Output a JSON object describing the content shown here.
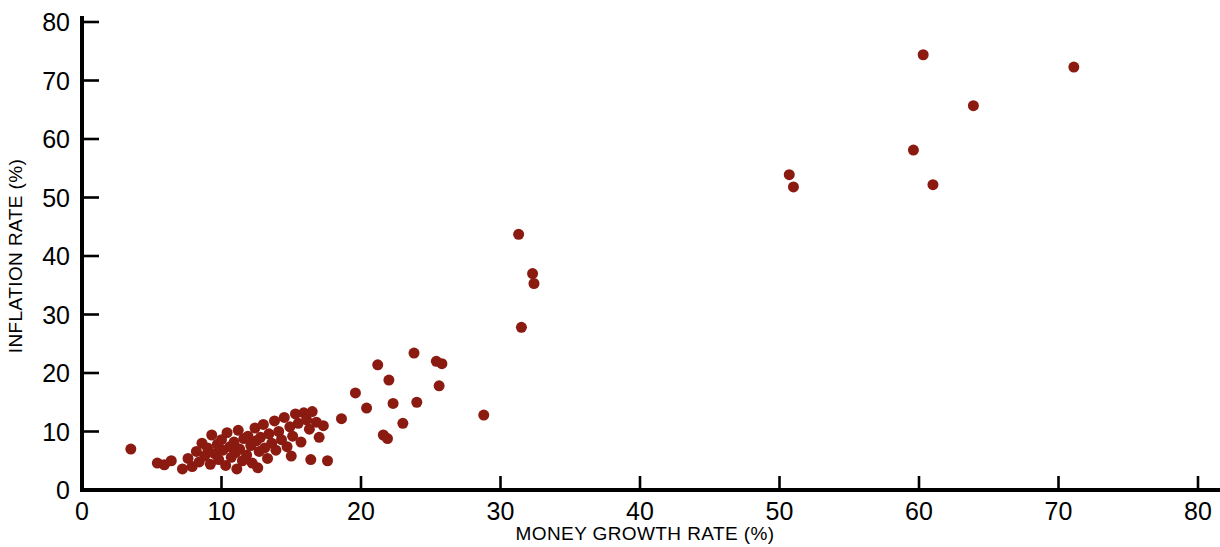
{
  "chart_data": {
    "type": "scatter",
    "title": "",
    "subtitle": "",
    "xlabel": "MONEY GROWTH RATE (%)",
    "ylabel": "INFLATION RATE (%)",
    "xlim": [
      0,
      80
    ],
    "ylim": [
      0,
      80
    ],
    "xticks": [
      0,
      10,
      20,
      30,
      40,
      50,
      60,
      70,
      80
    ],
    "yticks": [
      0,
      10,
      20,
      30,
      40,
      50,
      60,
      70,
      80
    ],
    "xtick_labels": [
      "0",
      "10",
      "20",
      "30",
      "40",
      "50",
      "60",
      "70",
      "80"
    ],
    "ytick_labels": [
      "0",
      "10",
      "20",
      "30",
      "40",
      "50",
      "60",
      "70",
      "80"
    ],
    "grid": false,
    "legend": null,
    "legend_position": "none",
    "annotations": [],
    "marker": {
      "shape": "circle",
      "color": "#8B1A10",
      "radius_px": 5.5,
      "edge_color": "none"
    },
    "series": [
      {
        "name": "Countries",
        "color": "#8B1A10",
        "points": [
          [
            3.5,
            7.0
          ],
          [
            5.4,
            4.6
          ],
          [
            5.9,
            4.3
          ],
          [
            6.4,
            5.0
          ],
          [
            7.2,
            3.6
          ],
          [
            7.6,
            5.4
          ],
          [
            7.9,
            4.0
          ],
          [
            8.2,
            6.6
          ],
          [
            8.4,
            4.8
          ],
          [
            8.6,
            8.0
          ],
          [
            8.8,
            5.8
          ],
          [
            9.0,
            7.2
          ],
          [
            9.2,
            4.4
          ],
          [
            9.3,
            9.4
          ],
          [
            9.5,
            6.2
          ],
          [
            9.7,
            7.8
          ],
          [
            9.8,
            5.2
          ],
          [
            10.0,
            8.6
          ],
          [
            10.1,
            6.8
          ],
          [
            10.3,
            4.2
          ],
          [
            10.4,
            9.8
          ],
          [
            10.6,
            7.4
          ],
          [
            10.7,
            5.6
          ],
          [
            10.9,
            8.2
          ],
          [
            11.0,
            6.4
          ],
          [
            11.2,
            10.2
          ],
          [
            11.3,
            7.0
          ],
          [
            11.5,
            5.0
          ],
          [
            11.6,
            8.8
          ],
          [
            11.8,
            6.0
          ],
          [
            11.9,
            9.2
          ],
          [
            12.1,
            7.6
          ],
          [
            12.2,
            4.6
          ],
          [
            12.4,
            10.6
          ],
          [
            12.5,
            8.4
          ],
          [
            12.7,
            6.6
          ],
          [
            12.8,
            9.0
          ],
          [
            13.0,
            11.2
          ],
          [
            13.1,
            7.2
          ],
          [
            13.3,
            5.4
          ],
          [
            13.4,
            9.6
          ],
          [
            13.6,
            8.0
          ],
          [
            13.8,
            11.8
          ],
          [
            13.9,
            6.8
          ],
          [
            14.1,
            10.0
          ],
          [
            14.3,
            8.6
          ],
          [
            14.5,
            12.4
          ],
          [
            14.7,
            7.4
          ],
          [
            14.9,
            10.8
          ],
          [
            15.1,
            9.2
          ],
          [
            15.3,
            13.0
          ],
          [
            15.5,
            11.4
          ],
          [
            15.7,
            8.2
          ],
          [
            15.9,
            13.2
          ],
          [
            16.1,
            12.0
          ],
          [
            16.3,
            10.4
          ],
          [
            16.5,
            13.4
          ],
          [
            16.8,
            11.6
          ],
          [
            17.0,
            9.0
          ],
          [
            17.3,
            11.0
          ],
          [
            17.6,
            5.0
          ],
          [
            16.4,
            5.2
          ],
          [
            15.0,
            5.8
          ],
          [
            12.6,
            3.8
          ],
          [
            11.1,
            3.6
          ],
          [
            18.6,
            12.2
          ],
          [
            19.6,
            16.6
          ],
          [
            20.4,
            14.0
          ],
          [
            21.2,
            21.4
          ],
          [
            21.6,
            9.4
          ],
          [
            21.9,
            8.8
          ],
          [
            22.0,
            18.8
          ],
          [
            22.3,
            14.8
          ],
          [
            23.0,
            11.4
          ],
          [
            23.8,
            23.4
          ],
          [
            24.0,
            15.0
          ],
          [
            25.4,
            22.0
          ],
          [
            25.6,
            17.8
          ],
          [
            25.8,
            21.6
          ],
          [
            28.8,
            12.8
          ],
          [
            31.3,
            43.7
          ],
          [
            31.5,
            27.8
          ],
          [
            32.3,
            37.0
          ],
          [
            32.4,
            35.3
          ],
          [
            50.7,
            53.9
          ],
          [
            51.0,
            51.8
          ],
          [
            59.6,
            58.1
          ],
          [
            60.3,
            74.4
          ],
          [
            61.0,
            52.2
          ],
          [
            63.9,
            65.7
          ],
          [
            71.1,
            72.3
          ]
        ]
      }
    ]
  },
  "axes": {
    "x_title": "MONEY GROWTH RATE (%)",
    "y_title": "INFLATION RATE (%)"
  }
}
